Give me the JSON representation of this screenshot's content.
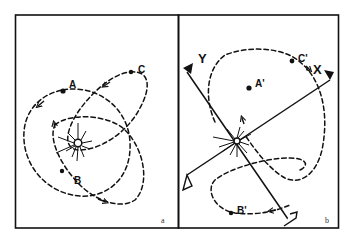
{
  "figure": {
    "panels": [
      {
        "id": "a",
        "label": "a",
        "points": [
          {
            "name": "A",
            "label": "A"
          },
          {
            "name": "B",
            "label": "B"
          },
          {
            "name": "C",
            "label": "C"
          }
        ],
        "center": "sun-like burst with small open circle"
      },
      {
        "id": "b",
        "label": "b",
        "points": [
          {
            "name": "A'",
            "label": "A'"
          },
          {
            "name": "B'",
            "label": "B'"
          },
          {
            "name": "C'",
            "label": "C'"
          }
        ],
        "axes": [
          {
            "name": "X",
            "label": "X"
          },
          {
            "name": "Y",
            "label": "Y"
          }
        ],
        "center": "sun-like burst with small open circle at axes origin"
      }
    ],
    "colors": {
      "ink": "#111111",
      "background": "#ffffff"
    }
  }
}
